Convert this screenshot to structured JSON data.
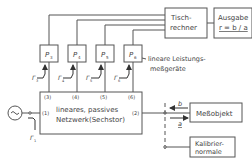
{
  "diagram": {
    "blocks": {
      "tischrechner": {
        "line1": "Tisch-",
        "line2": "rechner"
      },
      "ausgabe": {
        "line1": "Ausgabe",
        "line2": "r = b / a"
      },
      "network": {
        "line1": "lineares, passives",
        "line2": "Netzwerk(Sechstor)"
      },
      "messobjekt": {
        "label": "Meßobjekt"
      },
      "kalibrier": {
        "line1": "Kalibrier-",
        "line2": "normale"
      }
    },
    "detectors": [
      {
        "label": "P3",
        "main": "P",
        "sub": "3"
      },
      {
        "label": "P4",
        "main": "P",
        "sub": "4"
      },
      {
        "label": "P5",
        "main": "P",
        "sub": "5"
      },
      {
        "label": "P6",
        "main": "P",
        "sub": "6"
      }
    ],
    "detector_note": {
      "line1": "lineare Leistungs-",
      "line2": "meßgeräte"
    },
    "ports": [
      "(3)",
      "(4)",
      "(5)",
      "(6)",
      "(1)",
      "(2)"
    ],
    "gammas": [
      {
        "main": "Γ",
        "sub": "3"
      },
      {
        "main": "Γ",
        "sub": "4"
      },
      {
        "main": "Γ",
        "sub": "5"
      },
      {
        "main": "Γ",
        "sub": "6"
      },
      {
        "main": "Γ",
        "sub": "1"
      }
    ],
    "waves": {
      "b": "b",
      "a": "a"
    },
    "source": {
      "symbol": "~"
    }
  }
}
